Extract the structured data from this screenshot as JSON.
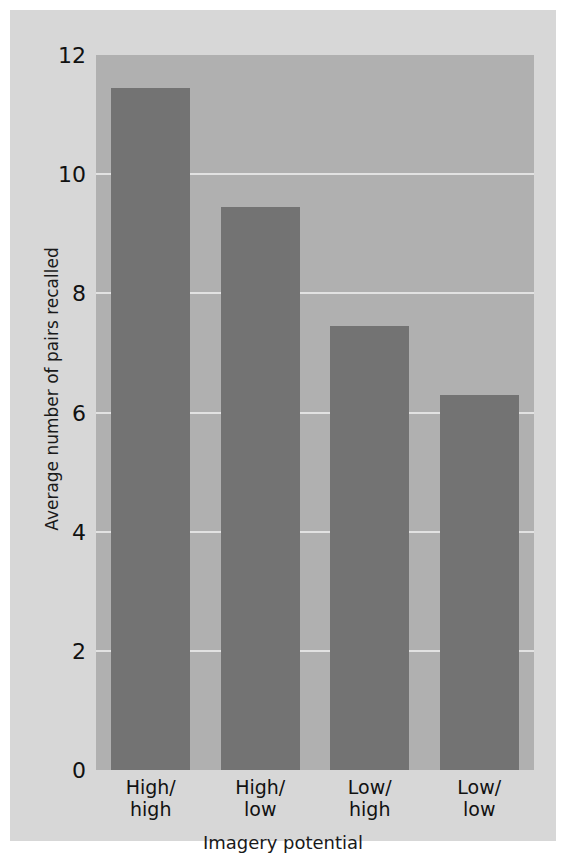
{
  "chart_data": {
    "type": "bar",
    "title": "",
    "subtitle": "",
    "xlabel": "Imagery potential",
    "ylabel": "Average number of pairs recalled",
    "categories": [
      "High/\nhigh",
      "High/\nlow",
      "Low/\nhigh",
      "Low/\nlow"
    ],
    "category_labels": [
      {
        "line1": "High/",
        "line2": "high"
      },
      {
        "line1": "High/",
        "line2": "low"
      },
      {
        "line1": "Low/",
        "line2": "high"
      },
      {
        "line1": "Low/",
        "line2": "low"
      }
    ],
    "values": [
      11.45,
      9.45,
      7.45,
      6.3
    ],
    "ylim": [
      0,
      12
    ],
    "xlim_note": "categorical",
    "yticks": [
      12,
      10,
      8,
      6,
      4,
      2,
      0
    ],
    "ytick_labels": [
      "12",
      "10",
      "8",
      "6",
      "4",
      "2",
      "0"
    ],
    "gridlines": {
      "on": true,
      "axis": "y",
      "values": [
        10,
        8,
        6,
        4,
        2
      ],
      "color": "#e2e2e2"
    },
    "legend": {
      "present": false,
      "position": "none"
    },
    "colors": {
      "bar": "#737373",
      "plot_background": "#b0b0b0",
      "figure_background": "#d7d7d7",
      "gridline": "#e2e2e2",
      "text": "#111111"
    }
  }
}
